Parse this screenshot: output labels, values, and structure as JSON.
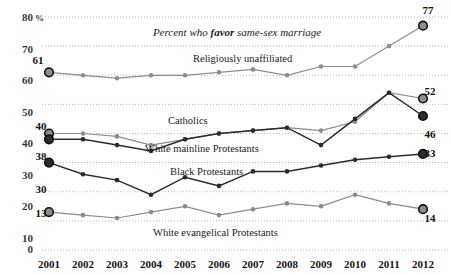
{
  "chart_data": {
    "type": "line",
    "title": "Percent who favor same-sex marriage",
    "title_parts": {
      "pre": "Percent who ",
      "bold": "favor",
      "post": " same-sex marriage"
    },
    "xlabel": "",
    "ylabel": "",
    "y_unit": "%",
    "ylim": [
      0,
      80
    ],
    "yticks": [
      0,
      10,
      20,
      30,
      40,
      50,
      60,
      70,
      80
    ],
    "ytick_labels": [
      "0",
      "10",
      "20",
      "30",
      "40",
      "50",
      "60",
      "70",
      "80"
    ],
    "grid": true,
    "grid_axis": "y",
    "legend_position": "inline-labels",
    "x": [
      2001,
      2002,
      2003,
      2004,
      2005,
      2006,
      2007,
      2008,
      2009,
      2010,
      2011,
      2012
    ],
    "categories": [
      "2001",
      "2002",
      "2003",
      "2004",
      "2005",
      "2006",
      "2007",
      "2008",
      "2009",
      "2010",
      "2011",
      "2012"
    ],
    "series": [
      {
        "name": "Religiously unaffiliated",
        "label": "Religiously unaffiliated",
        "color": "#8c8c8c",
        "start_value": 61,
        "end_value": 77,
        "start_label": "61",
        "end_label": "77",
        "values": [
          61,
          60,
          59,
          60,
          60,
          61,
          62,
          60,
          63,
          63,
          70,
          77
        ]
      },
      {
        "name": "Catholics",
        "label": "Catholics",
        "color": "#8c8c8c",
        "start_value": 40,
        "end_value": 52,
        "start_label": "40",
        "end_label": "52",
        "values": [
          40,
          40,
          39,
          36,
          38,
          40,
          41,
          42,
          41,
          44,
          54,
          52
        ]
      },
      {
        "name": "White mainline Protestants",
        "label": "White mainline Protestants",
        "color": "#2b2b2b",
        "start_value": 38,
        "end_value": 46,
        "start_label": "38",
        "end_label": "46",
        "values": [
          38,
          38,
          36,
          34,
          38,
          40,
          41,
          42,
          36,
          45,
          54,
          46
        ]
      },
      {
        "name": "Black Protestants",
        "label": "Black Protestants",
        "color": "#2b2b2b",
        "start_value": 30,
        "end_value": 33,
        "start_label": "30",
        "end_label": "33",
        "values": [
          30,
          26,
          24,
          19,
          25,
          22,
          27,
          27,
          29,
          31,
          32,
          33
        ]
      },
      {
        "name": "White evangelical Protestants",
        "label": "White evangelical Protestants",
        "color": "#8c8c8c",
        "start_value": 13,
        "end_value": 14,
        "start_label": "13",
        "end_label": "14",
        "values": [
          13,
          12,
          11,
          13,
          15,
          12,
          14,
          16,
          15,
          19,
          16,
          14
        ]
      }
    ],
    "annotations": [
      {
        "text": "Percent who favor same-sex marriage",
        "kind": "title"
      },
      {
        "text": "Religiously unaffiliated",
        "kind": "series-label"
      },
      {
        "text": "Catholics",
        "kind": "series-label"
      },
      {
        "text": "White mainline Protestants",
        "kind": "series-label"
      },
      {
        "text": "Black Protestants",
        "kind": "series-label"
      },
      {
        "text": "White evangelical Protestants",
        "kind": "series-label"
      }
    ]
  },
  "labels": {
    "y": {
      "t0": "0",
      "t10": "10",
      "t20": "20",
      "t30": "30",
      "t40": "40",
      "t50": "50",
      "t60": "60",
      "t70": "70",
      "t80": "80",
      "unit": "%"
    },
    "x": {
      "y2001": "2001",
      "y2002": "2002",
      "y2003": "2003",
      "y2004": "2004",
      "y2005": "2005",
      "y2006": "2006",
      "y2007": "2007",
      "y2008": "2008",
      "y2009": "2009",
      "y2010": "2010",
      "y2011": "2011",
      "y2012": "2012"
    },
    "title_pre": "Percent who ",
    "title_bold": "favor",
    "title_post": " same-sex marriage",
    "series": {
      "unaffiliated": "Religiously unaffiliated",
      "catholics": "Catholics",
      "mainline": "White mainline Protestants",
      "black": "Black Protestants",
      "evangelical": "White evangelical Protestants"
    },
    "endpoints": {
      "unaff_start": "61",
      "unaff_end": "77",
      "cath_start": "40",
      "cath_end": "52",
      "main_start": "38",
      "main_end": "46",
      "black_start": "30",
      "black_end": "33",
      "evan_start": "13",
      "evan_end": "14"
    }
  }
}
